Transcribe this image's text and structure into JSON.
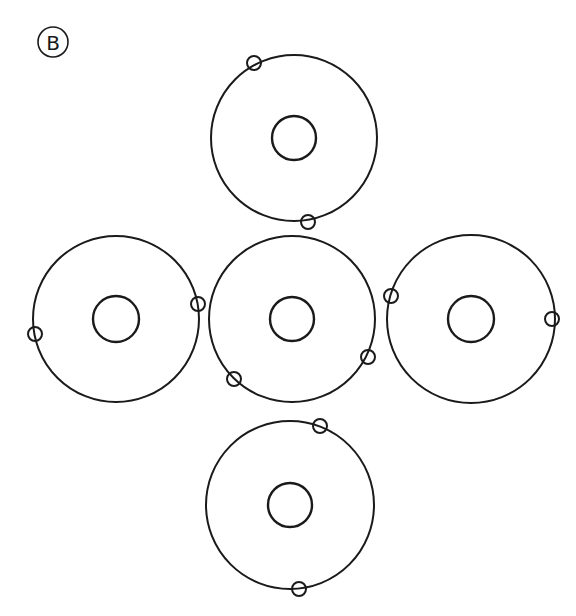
{
  "figure": {
    "label": "B",
    "label_position": {
      "cx": 53,
      "cy": 42,
      "r": 15
    },
    "stroke_color": "#1a1a1a",
    "background": "#ffffff"
  },
  "atoms": [
    {
      "id": "top",
      "cx": 294,
      "cy": 138,
      "outer_r": 83,
      "nucleus_r": 22,
      "electrons": [
        {
          "x": 254,
          "y": 63
        },
        {
          "x": 308,
          "y": 222
        }
      ]
    },
    {
      "id": "left",
      "cx": 116,
      "cy": 319,
      "outer_r": 83,
      "nucleus_r": 23,
      "electrons": [
        {
          "x": 198,
          "y": 304
        },
        {
          "x": 35,
          "y": 334
        }
      ]
    },
    {
      "id": "center",
      "cx": 292,
      "cy": 319,
      "outer_r": 83,
      "nucleus_r": 22,
      "electrons": [
        {
          "x": 368,
          "y": 357
        },
        {
          "x": 234,
          "y": 379
        }
      ]
    },
    {
      "id": "right",
      "cx": 471,
      "cy": 319,
      "outer_r": 84,
      "nucleus_r": 23,
      "electrons": [
        {
          "x": 391,
          "y": 296
        },
        {
          "x": 552,
          "y": 319
        }
      ]
    },
    {
      "id": "bottom",
      "cx": 290,
      "cy": 505,
      "outer_r": 84,
      "nucleus_r": 22,
      "electrons": [
        {
          "x": 320,
          "y": 426
        },
        {
          "x": 299,
          "y": 589
        }
      ]
    }
  ],
  "electron_r": 7
}
